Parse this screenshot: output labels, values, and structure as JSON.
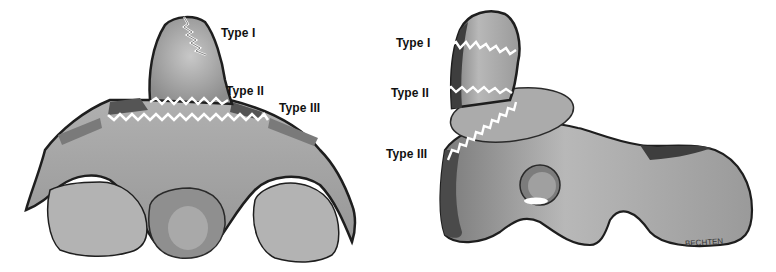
{
  "figure": {
    "views": [
      {
        "name": "anterior view",
        "labels": [
          "Type I",
          "Type II",
          "Type III"
        ]
      },
      {
        "name": "lateral view",
        "labels": [
          "Type I",
          "Type II",
          "Type III"
        ]
      }
    ],
    "signature": "BECHTEN",
    "colors": {
      "bone_fill": "#a8a8a8",
      "bone_light": "#c4c4c4",
      "bone_shadow": "#6e6e6e",
      "outline": "#1e1e1e",
      "fracture_line": "#ffffff"
    }
  }
}
